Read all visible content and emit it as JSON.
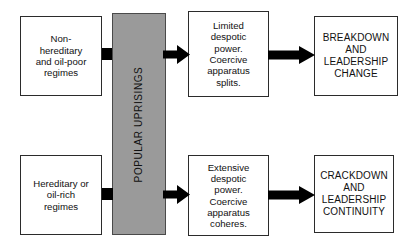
{
  "diagram": {
    "colors": {
      "band_fill": "#9a9a9a",
      "box_fill": "#ffffff",
      "box_border": "#2b2b2b",
      "arrow": "#000000",
      "text": "#111111"
    },
    "band": {
      "label": "POPULAR UPRISINGS",
      "orientation": "vertical-bottom-to-top"
    },
    "boxes": {
      "nonhereditary": "Non-\nhereditary\nand oil-poor\nregimes",
      "hereditary": "Hereditary or\noil-rich\nregimes",
      "limited": "Limited\ndespotic\npower.\nCoercive\napparatus\nsplits.",
      "extensive": "Extensive\ndespotic\npower.\nCoercive\napparatus\ncoheres.",
      "breakdown": "BREAKDOWN\nAND\nLEADERSHIP\nCHANGE",
      "crackdown": "CRACKDOWN\nAND\nLEADERSHIP\nCONTINUITY"
    },
    "arrows": [
      {
        "name": "nonhereditary-to-band",
        "from": "nonhereditary",
        "to": "band"
      },
      {
        "name": "band-to-limited",
        "from": "band",
        "to": "limited"
      },
      {
        "name": "limited-to-breakdown",
        "from": "limited",
        "to": "breakdown"
      },
      {
        "name": "hereditary-to-band",
        "from": "hereditary",
        "to": "band"
      },
      {
        "name": "band-to-extensive",
        "from": "band",
        "to": "extensive"
      },
      {
        "name": "extensive-to-crackdown",
        "from": "extensive",
        "to": "crackdown"
      }
    ]
  }
}
